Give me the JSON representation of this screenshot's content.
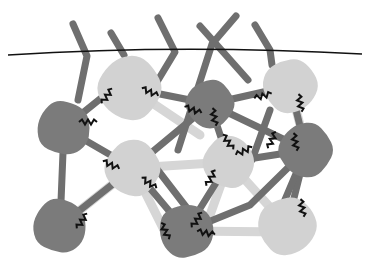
{
  "diagram": {
    "colors": {
      "background": "#ffffff",
      "dark_node": "#7b7b7b",
      "light_node": "#d2d2d2",
      "dark_rod": "#6f6f6f",
      "light_rod": "#d6d6d6",
      "zigzag": "#111111",
      "surface_line": "#111111"
    },
    "surface_line": {
      "path": "M 8 55 Q 180 44 362 54"
    },
    "nodes": [
      {
        "id": "L1",
        "type": "light",
        "cx": 130,
        "cy": 88,
        "r": 33
      },
      {
        "id": "D1",
        "type": "dark",
        "cx": 64,
        "cy": 128,
        "r": 28
      },
      {
        "id": "D2",
        "type": "dark",
        "cx": 210,
        "cy": 104,
        "r": 25
      },
      {
        "id": "L2",
        "type": "light",
        "cx": 290,
        "cy": 86,
        "r": 28
      },
      {
        "id": "L3",
        "type": "light",
        "cx": 133,
        "cy": 168,
        "r": 29
      },
      {
        "id": "L4",
        "type": "light",
        "cx": 229,
        "cy": 162,
        "r": 27
      },
      {
        "id": "D3",
        "type": "dark",
        "cx": 306,
        "cy": 150,
        "r": 28
      },
      {
        "id": "D4",
        "type": "dark",
        "cx": 60,
        "cy": 226,
        "r": 28
      },
      {
        "id": "D5",
        "type": "dark",
        "cx": 186,
        "cy": 231,
        "r": 28
      },
      {
        "id": "L5",
        "type": "light",
        "cx": 287,
        "cy": 226,
        "r": 30
      }
    ],
    "rods": [
      {
        "type": "dark",
        "d": "M 73 24 L 87 56 L 78 100"
      },
      {
        "type": "dark",
        "d": "M 111 33 L 124 55"
      },
      {
        "type": "dark",
        "d": "M 158 18 L 175 52 L 140 110"
      },
      {
        "type": "dark",
        "d": "M 200 26 L 248 80"
      },
      {
        "type": "dark",
        "d": "M 236 16 L 212 44 L 178 150"
      },
      {
        "type": "dark",
        "d": "M 255 25 L 270 50 L 272 65"
      },
      {
        "type": "dark",
        "d": "M 64 128 L 133 168"
      },
      {
        "type": "dark",
        "d": "M 64 128 L 105 95"
      },
      {
        "type": "dark",
        "d": "M 64 128 L 60 226"
      },
      {
        "type": "dark",
        "d": "M 60 226 L 133 168"
      },
      {
        "type": "dark",
        "d": "M 130 88 L 210 104"
      },
      {
        "type": "dark",
        "d": "M 210 104 L 290 86"
      },
      {
        "type": "dark",
        "d": "M 210 104 L 306 150"
      },
      {
        "type": "dark",
        "d": "M 210 104 L 229 162"
      },
      {
        "type": "dark",
        "d": "M 210 104 L 133 168"
      },
      {
        "type": "dark",
        "d": "M 290 86 L 306 150"
      },
      {
        "type": "dark",
        "d": "M 270 110 L 252 160"
      },
      {
        "type": "dark",
        "d": "M 229 162 L 306 150"
      },
      {
        "type": "dark",
        "d": "M 306 150 L 287 226"
      },
      {
        "type": "dark",
        "d": "M 306 150 L 250 205 L 186 231"
      },
      {
        "type": "dark",
        "d": "M 133 168 L 186 231"
      },
      {
        "type": "dark",
        "d": "M 150 160 L 200 225"
      },
      {
        "type": "dark",
        "d": "M 229 162 L 186 231"
      },
      {
        "type": "dark",
        "d": "M 306 150 L 270 235"
      },
      {
        "type": "light",
        "d": "M 133 168 L 60 226"
      },
      {
        "type": "light",
        "d": "M 133 168 L 229 162"
      },
      {
        "type": "light",
        "d": "M 133 168 L 165 232"
      },
      {
        "type": "light",
        "d": "M 229 162 L 287 226"
      },
      {
        "type": "light",
        "d": "M 229 162 L 210 215"
      },
      {
        "type": "light",
        "d": "M 186 231 L 287 232"
      },
      {
        "type": "light",
        "d": "M 130 88 L 200 135"
      },
      {
        "type": "light",
        "d": "M 290 86 L 300 125"
      }
    ],
    "zigzags": [
      {
        "x": 107,
        "y": 96,
        "angle": -55
      },
      {
        "x": 150,
        "y": 92,
        "angle": 25
      },
      {
        "x": 193,
        "y": 110,
        "angle": 20
      },
      {
        "x": 214,
        "y": 117,
        "angle": 80
      },
      {
        "x": 263,
        "y": 96,
        "angle": -15
      },
      {
        "x": 300,
        "y": 103,
        "angle": 80
      },
      {
        "x": 295,
        "y": 142,
        "angle": 80
      },
      {
        "x": 111,
        "y": 165,
        "angle": 25
      },
      {
        "x": 149,
        "y": 183,
        "angle": 35
      },
      {
        "x": 82,
        "y": 221,
        "angle": -55
      },
      {
        "x": 165,
        "y": 231,
        "angle": 65
      },
      {
        "x": 197,
        "y": 220,
        "angle": -55
      },
      {
        "x": 228,
        "y": 142,
        "angle": 55
      },
      {
        "x": 244,
        "y": 151,
        "angle": -25
      },
      {
        "x": 211,
        "y": 178,
        "angle": -60
      },
      {
        "x": 272,
        "y": 140,
        "angle": -65
      },
      {
        "x": 206,
        "y": 233,
        "angle": 10
      },
      {
        "x": 302,
        "y": 208,
        "angle": 80
      },
      {
        "x": 88,
        "y": 122,
        "angle": 0
      }
    ]
  }
}
